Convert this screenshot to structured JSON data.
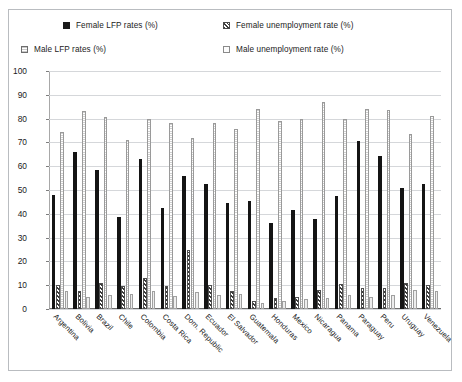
{
  "chart_data": {
    "type": "bar",
    "title": "",
    "xlabel": "",
    "ylabel": "",
    "ylim": [
      0,
      100
    ],
    "yticks": [
      0,
      10,
      20,
      30,
      40,
      50,
      60,
      70,
      80,
      90,
      100
    ],
    "grid": true,
    "legend_position": "top",
    "categories": [
      "Argentina",
      "Bolivia",
      "Brazil",
      "Chile",
      "Colombia",
      "Costa Rica",
      "Dom. Republic",
      "Ecuador",
      "El Salvador",
      "Guatemala",
      "Honduras",
      "Mexico",
      "Nicaragua",
      "Panama",
      "Paraguay",
      "Peru",
      "Uruguay",
      "Venezuela"
    ],
    "series": [
      {
        "name": "Female LFP rates (%)",
        "key": "femlfp",
        "values": [
          48,
          66,
          58.5,
          38.5,
          63,
          42.5,
          56,
          52.5,
          44.5,
          45.5,
          36,
          41.5,
          38,
          47.5,
          70.5,
          64.5,
          51,
          52.5
        ]
      },
      {
        "name": "Female unemployment rate (%)",
        "key": "femun",
        "values": [
          10,
          7.5,
          11,
          9.5,
          13,
          9.5,
          25,
          10,
          7.5,
          3.5,
          4.5,
          5,
          8,
          10.5,
          9,
          9,
          11,
          10
        ]
      },
      {
        "name": "Male LFP rates (%)",
        "key": "malelfp",
        "values": [
          74.5,
          83,
          80.5,
          71,
          80,
          78,
          72,
          78,
          75.5,
          84,
          79,
          80,
          87,
          80,
          84,
          83.5,
          73.5,
          81
        ]
      },
      {
        "name": "Male unemployment rate (%)",
        "key": "maleun",
        "values": [
          7.5,
          5,
          6,
          6.5,
          7.5,
          5.5,
          7,
          6,
          6.5,
          2.5,
          3.5,
          4,
          4.5,
          6,
          5,
          6,
          8,
          7.5
        ]
      }
    ]
  },
  "legend": {
    "items": [
      {
        "label": "Female LFP rates (%)",
        "swatch": "femlfp"
      },
      {
        "label": "Female unemployment rate (%)",
        "swatch": "femun"
      },
      {
        "label": "Male LFP rates (%)",
        "swatch": "malelfp"
      },
      {
        "label": "Male unemployment rate (%)",
        "swatch": "maleun"
      }
    ]
  },
  "colors": {
    "female_lfp": "#141414",
    "female_unemployment": "#3a3a3a",
    "male_lfp": "#cfcfcf",
    "male_unemployment": "#ededed",
    "grid": "#d5d7da",
    "border": "#b9bcc0"
  }
}
